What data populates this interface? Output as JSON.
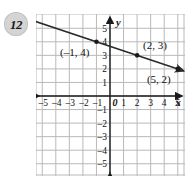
{
  "problem": {
    "number": "12"
  },
  "chart_data": {
    "type": "line",
    "title": "",
    "xlabel": "x",
    "ylabel": "y",
    "grid": true,
    "legend": false,
    "xlim": [
      -5.6,
      5.6
    ],
    "ylim": [
      -5.6,
      5.6
    ],
    "xticks": [
      -5,
      -4,
      -3,
      -2,
      -1,
      0,
      1,
      2,
      3,
      4,
      5
    ],
    "yticks": [
      5,
      4,
      3,
      2,
      1,
      -1,
      -2,
      -3,
      -4,
      -5
    ],
    "xtick_labels": [
      "–5",
      "–4",
      "–3",
      "–2",
      "–1",
      "0",
      "1",
      "2",
      "3",
      "4",
      "5"
    ],
    "ytick_labels": [
      "5",
      "4",
      "3",
      "2",
      "1",
      "–1",
      "–2",
      "–3",
      "–4",
      "–5"
    ],
    "origin_label": "0",
    "series": [
      {
        "name": "line",
        "slope": -0.3333,
        "intercept": 3.6667,
        "arrows": "both",
        "color": "#2b2b2b",
        "points": [
          {
            "x": -1,
            "y": 4,
            "label": "(–1, 4)",
            "label_pos": "below-left"
          },
          {
            "x": 2,
            "y": 3,
            "label": "(2, 3)",
            "label_pos": "above-right"
          },
          {
            "x": 5,
            "y": 2,
            "label": "(5, 2)",
            "label_pos": "below-left"
          }
        ]
      }
    ],
    "colors": {
      "grid": "#b9b9b9",
      "axis": "#1a1a1a",
      "line": "#2b2b2b",
      "point": "#1a1a1a",
      "background": "#ffffff"
    }
  }
}
